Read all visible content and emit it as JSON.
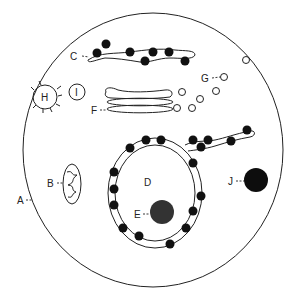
{
  "diagram": {
    "title": "",
    "labels": {
      "A": "A",
      "B": "B",
      "C": "C",
      "D": "D",
      "E": "E",
      "F": "F",
      "G": "G",
      "H": "H",
      "I": "I",
      "J": "J"
    },
    "colors": {
      "stroke": "#222222",
      "ribosome": "#111111",
      "nucleolus": "#333333",
      "background": "#ffffff"
    }
  }
}
